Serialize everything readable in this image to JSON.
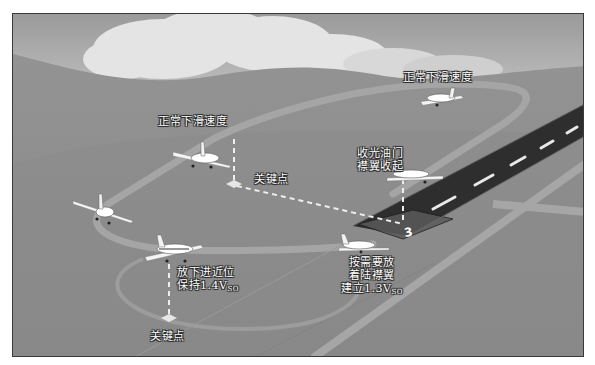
{
  "diagram": {
    "type": "traffic-pattern-landing-illustration",
    "colors": {
      "sky_top": "#9a9a9a",
      "sky_bottom": "#d2d2d2",
      "cloud": "#e6e6e6",
      "ground": "#8e8e8e",
      "pattern_track": "#a4a4a4",
      "runway": "#2e2e2e",
      "runway_stripe": "#e8e8e8",
      "dashed_line": "#eeeeee",
      "label_text": "#ffffff"
    },
    "labels": {
      "downwind_speed_top": "正常下滑速度",
      "downwind_speed_left": "正常下滑速度",
      "key_point_mid": "关键点",
      "key_point_bottom": "关键点",
      "throttle_line1": "收光油门",
      "throttle_line2": "襟翼收起",
      "gear_line1": "放下进近位",
      "gear_line2_prefix": "保持1.4V",
      "gear_line2_sub": "SO",
      "final_line1": "按需要放",
      "final_line2": "着陆襟翼",
      "final_line3_prefix": "建立1.3V",
      "final_line3_sub": "SO"
    },
    "runway": {
      "number": "3"
    },
    "airplanes": [
      {
        "position": "downwind-far",
        "x": 428,
        "y": 90
      },
      {
        "position": "downwind-left",
        "x": 195,
        "y": 152
      },
      {
        "position": "base-turn",
        "x": 95,
        "y": 208
      },
      {
        "position": "final-gear-down",
        "x": 170,
        "y": 248
      },
      {
        "position": "short-final",
        "x": 355,
        "y": 244
      },
      {
        "position": "takeoff-climb",
        "x": 405,
        "y": 170
      }
    ]
  }
}
